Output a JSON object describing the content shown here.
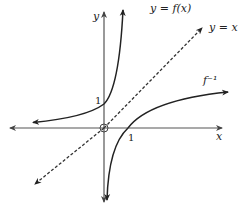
{
  "diagram": {
    "axes": {
      "x_label": "x",
      "y_label": "y",
      "x_tick": "1",
      "y_tick": "1"
    },
    "curves": [
      {
        "name": "f",
        "label": "y = f(x)",
        "type": "exponential",
        "passes_through": [
          0,
          1
        ]
      },
      {
        "name": "f_inverse",
        "label": "f⁻¹",
        "type": "logarithmic",
        "passes_through": [
          1,
          0
        ]
      },
      {
        "name": "identity",
        "label": "y = x",
        "style": "dashed"
      }
    ],
    "colors": {
      "axis": "#555555",
      "curve": "#222222",
      "dashed": "#333333"
    }
  }
}
